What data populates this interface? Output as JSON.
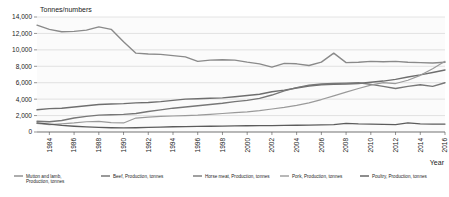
{
  "chart_data": {
    "type": "line",
    "title": "",
    "ylabel": "Tonnes/numbers",
    "xlabel": "Year",
    "ylim": [
      0,
      14000
    ],
    "ytick_labels": [
      "0",
      "2,000",
      "4,000",
      "6,000",
      "8,000",
      "10,000",
      "12,000",
      "14,000"
    ],
    "ytick_values": [
      0,
      2000,
      4000,
      6000,
      8000,
      10000,
      12000,
      14000
    ],
    "grid": true,
    "legend_position": "bottom",
    "x": [
      1983,
      1984,
      1985,
      1986,
      1987,
      1988,
      1989,
      1990,
      1991,
      1992,
      1993,
      1994,
      1995,
      1996,
      1997,
      1998,
      1999,
      2000,
      2001,
      2002,
      2003,
      2004,
      2005,
      2006,
      2007,
      2008,
      2009,
      2010,
      2011,
      2012,
      2013,
      2014,
      2015,
      2016
    ],
    "xtick_labels": [
      "1984",
      "1986",
      "1988",
      "1990",
      "1992",
      "1994",
      "1996",
      "1998",
      "2000",
      "2002",
      "2004",
      "2006",
      "2008",
      "2010",
      "2012",
      "2014",
      "2016"
    ],
    "xtick_values": [
      1984,
      1986,
      1988,
      1990,
      1992,
      1994,
      1996,
      1998,
      2000,
      2002,
      2004,
      2006,
      2008,
      2010,
      2012,
      2014,
      2016
    ],
    "series": [
      {
        "name": "Mutton and lamb, Production, tonnes",
        "color": "#8a8a8a",
        "width": 1.4,
        "values": [
          13000,
          12500,
          12200,
          12250,
          12400,
          12800,
          12500,
          11000,
          9600,
          9500,
          9450,
          9300,
          9150,
          8600,
          8750,
          8800,
          8750,
          8500,
          8300,
          7900,
          8350,
          8300,
          8100,
          8500,
          9600,
          8450,
          8500,
          8600,
          8550,
          8600,
          8500,
          8450,
          8400,
          8500
        ]
      },
      {
        "name": "Beef, Production, tonnes",
        "color": "#6e6e6e",
        "width": 1.4,
        "values": [
          2700,
          2850,
          2900,
          3050,
          3200,
          3350,
          3400,
          3450,
          3550,
          3600,
          3700,
          3850,
          4000,
          4050,
          4100,
          4150,
          4300,
          4450,
          4600,
          4900,
          5100,
          5350,
          5600,
          5750,
          5800,
          5850,
          5900,
          6050,
          6200,
          6400,
          6700,
          6950,
          7250,
          7550
        ]
      },
      {
        "name": "Horse meat, Production, tonnes",
        "color": "#777777",
        "width": 1.4,
        "values": [
          1300,
          1250,
          1400,
          1700,
          1900,
          2050,
          2100,
          2150,
          2250,
          2500,
          2700,
          2900,
          3050,
          3200,
          3350,
          3500,
          3700,
          3850,
          4100,
          4500,
          5000,
          5400,
          5700,
          5850,
          5900,
          5950,
          6000,
          5800,
          5550,
          5300,
          5550,
          5750,
          5550,
          6000
        ]
      },
      {
        "name": "Pork, Production, tonnes",
        "color": "#9a9a9a",
        "width": 1.2,
        "values": [
          1050,
          900,
          1000,
          1100,
          1250,
          1300,
          1150,
          1100,
          1700,
          1800,
          1900,
          1950,
          2000,
          2050,
          2150,
          2250,
          2350,
          2450,
          2600,
          2800,
          3000,
          3250,
          3550,
          3950,
          4400,
          4850,
          5300,
          5700,
          6000,
          5900,
          6300,
          6900,
          7700,
          8600
        ]
      },
      {
        "name": "Poultry, Production, tonnes",
        "color": "#5c5c5c",
        "width": 1.3,
        "values": [
          1100,
          950,
          800,
          700,
          620,
          560,
          520,
          500,
          520,
          560,
          600,
          640,
          660,
          680,
          700,
          720,
          740,
          760,
          770,
          780,
          800,
          820,
          840,
          860,
          900,
          1050,
          980,
          950,
          930,
          900,
          1100,
          980,
          950,
          960
        ]
      }
    ]
  },
  "legend": {
    "items": [
      {
        "label": "Mutton and lamb, Production, tonnes",
        "color": "#8a8a8a"
      },
      {
        "label": "Beef, Production, tonnes",
        "color": "#6e6e6e"
      },
      {
        "label": "Horse meat, Production, tonnes",
        "color": "#777777"
      },
      {
        "label": "Pork, Production, tonnes",
        "color": "#9a9a9a"
      },
      {
        "label": "Poultry, Production, tonnes",
        "color": "#5c5c5c"
      }
    ]
  }
}
